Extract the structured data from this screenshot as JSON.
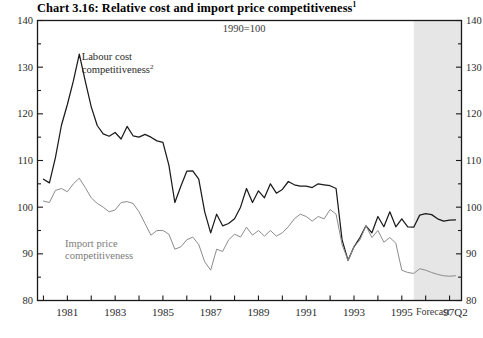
{
  "chart_data": {
    "type": "line",
    "title": "Chart 3.16: Relative cost and import price competitiveness",
    "title_superscript": "1",
    "subtitle": "1990=100",
    "xlabel": "",
    "ylabel": "",
    "ylim": [
      80,
      140
    ],
    "ytick_labels": [
      "80",
      "90",
      "100",
      "110",
      "120",
      "130",
      "140"
    ],
    "ytick_values": [
      80,
      90,
      100,
      110,
      120,
      130,
      140
    ],
    "y_minor_step": 5,
    "xlim": [
      1979.75,
      1997.5
    ],
    "xtick_labels": [
      "1981",
      "1983",
      "1985",
      "1987",
      "1989",
      "1991",
      "1993",
      "1995",
      "97Q2"
    ],
    "xtick_values": [
      1981,
      1983,
      1985,
      1987,
      1989,
      1991,
      1993,
      1995,
      1997.25
    ],
    "x_minor_step": 1,
    "grid": false,
    "legend_position": "inline-annotations",
    "annotations": [
      {
        "name": "forecast-label",
        "text": "Forecast",
        "x": 1996.3,
        "y": 77.0
      },
      {
        "name": "subtitle-label",
        "text": "1990=100",
        "x": 1988.4,
        "y": 137.5
      }
    ],
    "shaded_region": {
      "name": "forecast-band",
      "label": "Forecast",
      "x_start": 1995.5,
      "x_end": 1997.5,
      "color": "#e6e6e6"
    },
    "series": [
      {
        "name": "Labour cost competitiveness",
        "superscript": "2",
        "color": "#1b1b1b",
        "label_x": 1981.6,
        "label_y": 131.5,
        "x": [
          1980.0,
          1980.25,
          1980.5,
          1980.75,
          1981.0,
          1981.25,
          1981.5,
          1981.75,
          1982.0,
          1982.25,
          1982.5,
          1982.75,
          1983.0,
          1983.25,
          1983.5,
          1983.75,
          1984.0,
          1984.25,
          1984.5,
          1984.75,
          1985.0,
          1985.25,
          1985.5,
          1985.75,
          1986.0,
          1986.25,
          1986.5,
          1986.75,
          1987.0,
          1987.25,
          1987.5,
          1987.75,
          1988.0,
          1988.25,
          1988.5,
          1988.75,
          1989.0,
          1989.25,
          1989.5,
          1989.75,
          1990.0,
          1990.25,
          1990.5,
          1990.75,
          1991.0,
          1991.25,
          1991.5,
          1991.75,
          1992.0,
          1992.25,
          1992.5,
          1992.75,
          1993.0,
          1993.25,
          1993.5,
          1993.75,
          1994.0,
          1994.25,
          1994.5,
          1994.75,
          1995.0,
          1995.25,
          1995.5,
          1995.75,
          1996.0,
          1996.25,
          1996.5,
          1996.75,
          1997.0,
          1997.25
        ],
        "values": [
          106.0,
          105.2,
          110.6,
          117.5,
          122.0,
          127.0,
          132.8,
          127.0,
          121.5,
          117.5,
          115.7,
          115.2,
          116.0,
          114.6,
          117.3,
          115.3,
          115.0,
          115.6,
          115.0,
          114.2,
          113.9,
          109.0,
          101.0,
          104.5,
          107.7,
          107.8,
          106.0,
          99.0,
          94.5,
          98.5,
          96.0,
          96.5,
          97.5,
          100.0,
          104.0,
          101.0,
          103.5,
          102.0,
          105.0,
          103.0,
          103.8,
          105.5,
          104.8,
          104.5,
          104.5,
          104.2,
          105.0,
          104.8,
          104.6,
          104.0,
          93.0,
          88.6,
          91.5,
          93.5,
          96.0,
          94.5,
          98.0,
          95.8,
          99.0,
          95.8,
          97.5,
          95.8,
          95.7,
          98.3,
          98.6,
          98.4,
          97.5,
          97.0,
          97.2,
          97.3
        ]
      },
      {
        "name": "Import price competitiveness",
        "superscript": "",
        "color": "#8c8c8c",
        "label_x": 1980.9,
        "label_y": 91.5,
        "x": [
          1980.0,
          1980.25,
          1980.5,
          1980.75,
          1981.0,
          1981.25,
          1981.5,
          1981.75,
          1982.0,
          1982.25,
          1982.5,
          1982.75,
          1983.0,
          1983.25,
          1983.5,
          1983.75,
          1984.0,
          1984.25,
          1984.5,
          1984.75,
          1985.0,
          1985.25,
          1985.5,
          1985.75,
          1986.0,
          1986.25,
          1986.5,
          1986.75,
          1987.0,
          1987.25,
          1987.5,
          1987.75,
          1988.0,
          1988.25,
          1988.5,
          1988.75,
          1989.0,
          1989.25,
          1989.5,
          1989.75,
          1990.0,
          1990.25,
          1990.5,
          1990.75,
          1991.0,
          1991.25,
          1991.5,
          1991.75,
          1992.0,
          1992.25,
          1992.5,
          1992.75,
          1993.0,
          1993.25,
          1993.5,
          1993.75,
          1994.0,
          1994.25,
          1994.5,
          1994.75,
          1995.0,
          1995.25,
          1995.5,
          1995.75,
          1996.0,
          1996.25,
          1996.5,
          1996.75,
          1997.0,
          1997.25
        ],
        "values": [
          101.3,
          101.0,
          103.6,
          104.0,
          103.3,
          105.0,
          106.2,
          104.2,
          102.0,
          100.8,
          100.0,
          99.0,
          99.4,
          101.0,
          101.2,
          100.8,
          99.0,
          96.5,
          94.0,
          95.0,
          95.0,
          94.2,
          91.0,
          91.5,
          93.0,
          93.6,
          92.0,
          88.3,
          86.5,
          91.0,
          90.5,
          93.0,
          94.2,
          93.6,
          95.7,
          94.0,
          95.0,
          93.8,
          95.0,
          93.8,
          94.5,
          95.8,
          97.5,
          98.5,
          98.0,
          97.0,
          98.0,
          97.5,
          99.5,
          98.5,
          92.0,
          88.6,
          91.5,
          93.0,
          96.0,
          93.5,
          95.0,
          92.5,
          93.5,
          92.3,
          86.5,
          86.0,
          85.8,
          86.8,
          86.5,
          86.0,
          85.6,
          85.3,
          85.2,
          85.3
        ]
      }
    ]
  }
}
